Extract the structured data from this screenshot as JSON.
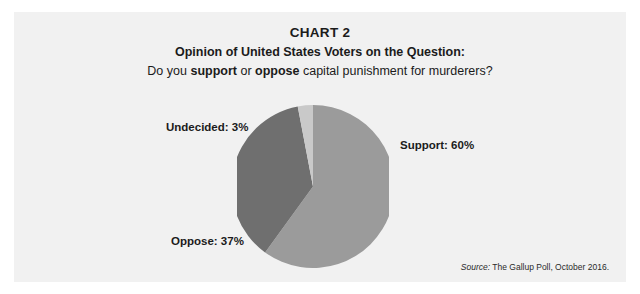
{
  "panel": {
    "background_color": "#f1f1f1",
    "page_background_color": "#ffffff"
  },
  "header": {
    "chart_number": "CHART 2",
    "subtitle_line1": "Opinion of United States Voters on the Question:",
    "question": {
      "prefix": "Do you ",
      "emphasis_1": "support",
      "middle": " or ",
      "emphasis_2": "oppose",
      "suffix": " capital punishment for murderers?"
    }
  },
  "labels": {
    "support": "Support: 60%",
    "oppose": "Oppose: 37%",
    "undecided": "Undecided: 3%"
  },
  "source": {
    "label": "Source:",
    "text": " The Gallup Poll, October 2016."
  },
  "chart_data": {
    "type": "pie",
    "title": "CHART 2",
    "subtitle": "Opinion of United States Voters on the Question: Do you support or oppose capital punishment for murderers?",
    "categories": [
      "Support",
      "Oppose",
      "Undecided"
    ],
    "values": [
      60,
      37,
      3
    ],
    "value_unit": "percent",
    "data_labels": [
      "Support: 60%",
      "Oppose: 37%",
      "Undecided: 3%"
    ],
    "colors": [
      "#9b9b9b",
      "#6f6f6f",
      "#c9c9c9"
    ],
    "start_angle_deg": 0,
    "direction": "clockwise",
    "legend": "none",
    "legend_position": "outside-labels",
    "grid": false,
    "xlabel": "",
    "ylabel": "",
    "source": "Source: The Gallup Poll, October 2016."
  }
}
